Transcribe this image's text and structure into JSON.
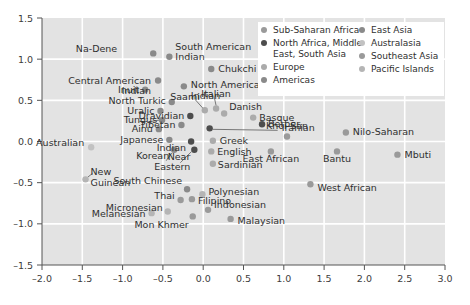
{
  "chart_data": {
    "type": "scatter",
    "title": "",
    "xlabel": "",
    "ylabel": "",
    "xlim": [
      -2.0,
      3.0
    ],
    "ylim": [
      -1.5,
      1.5
    ],
    "xticks": [
      "-2.0",
      "-1.5",
      "-1.0",
      "-0.5",
      "0.0",
      "0.5",
      "1.0",
      "1.5",
      "2.0",
      "2.5",
      "3.0"
    ],
    "yticks": [
      "1.5",
      "1.0",
      "0.5",
      "0.0",
      "-0.5",
      "-1.0",
      "-1.5"
    ],
    "grid": true,
    "grid_color": "#ffffff",
    "plot_background": "#e3e3e3",
    "legend_position": "top-right",
    "legend": [
      {
        "label": "Sub-Saharan Africa",
        "color": "#9a9a9a"
      },
      {
        "label": "North Africa, Middle East, South Asia",
        "color": "#4d4d4d"
      },
      {
        "label": "Europe",
        "color": "#ababab"
      },
      {
        "label": "Americas",
        "color": "#8a8a8a"
      },
      {
        "label": "East Asia",
        "color": "#8a8a8a"
      },
      {
        "label": "Australasia",
        "color": "#c2c2c2"
      },
      {
        "label": "Southeast Asia",
        "color": "#9a9a9a"
      },
      {
        "label": "Pacific Islands",
        "color": "#b5b5b5"
      }
    ],
    "points": [
      {
        "name": "Na-Dene",
        "x": -0.62,
        "y": 1.07,
        "color": "#8a8a8a",
        "label_dx": -36,
        "label_dy": -1,
        "anchor": "end"
      },
      {
        "name": "South American Indian",
        "x": -0.42,
        "y": 1.03,
        "color": "#8a8a8a",
        "label_dx": 6,
        "label_dy": -7,
        "anchor": "start",
        "lines": 2,
        "line2": "Indian"
      },
      {
        "name": "Chukchi",
        "x": 0.1,
        "y": 0.88,
        "color": "#8a8a8a",
        "label_dx": 7,
        "label_dy": 3,
        "anchor": "start"
      },
      {
        "name": "Central American Indian",
        "x": -0.56,
        "y": 0.74,
        "color": "#8a8a8a",
        "label_dx": -7,
        "label_dy": 3,
        "anchor": "end",
        "lines": 2
      },
      {
        "name": "North American Indian",
        "x": -0.24,
        "y": 0.67,
        "color": "#8a8a8a",
        "label_dx": 7,
        "label_dy": 2,
        "anchor": "start",
        "lines": 2
      },
      {
        "name": "Inuit",
        "x": -0.72,
        "y": 0.63,
        "color": "#8a8a8a",
        "label_dx": -6,
        "label_dy": 3,
        "anchor": "end"
      },
      {
        "name": "North Turkic",
        "x": -0.39,
        "y": 0.48,
        "color": "#8a8a8a",
        "label_dx": -6,
        "label_dy": 2,
        "anchor": "end"
      },
      {
        "name": "Saami",
        "x": 0.02,
        "y": 0.38,
        "color": "#ababab",
        "label_dx": -5,
        "label_dy": -10,
        "anchor": "end"
      },
      {
        "name": "Italian",
        "x": 0.16,
        "y": 0.4,
        "color": "#ababab",
        "label_dx": 0,
        "label_dy": -12,
        "anchor": "middle"
      },
      {
        "name": "Danish",
        "x": 0.26,
        "y": 0.34,
        "color": "#ababab",
        "label_dx": 5,
        "label_dy": -4,
        "anchor": "start"
      },
      {
        "name": "Uralic",
        "x": -0.53,
        "y": 0.37,
        "color": "#8a8a8a",
        "label_dx": -6,
        "label_dy": 3,
        "anchor": "end"
      },
      {
        "name": "Dravidian",
        "x": -0.16,
        "y": 0.31,
        "color": "#4d4d4d",
        "label_dx": -6,
        "label_dy": 3,
        "anchor": "end"
      },
      {
        "name": "Tungus",
        "x": -0.51,
        "y": 0.26,
        "color": "#8a8a8a",
        "label_dx": -5,
        "label_dy": 3,
        "anchor": "end"
      },
      {
        "name": "Basque",
        "x": 0.62,
        "y": 0.29,
        "color": "#ababab",
        "label_dx": 6,
        "label_dy": 3,
        "anchor": "start"
      },
      {
        "name": "Tibetan",
        "x": -0.27,
        "y": 0.2,
        "color": "#8a8a8a",
        "label_dx": -6,
        "label_dy": 3,
        "anchor": "end"
      },
      {
        "name": "Berber",
        "x": 0.73,
        "y": 0.21,
        "color": "#4d4d4d",
        "label_dx": 6,
        "label_dy": 3,
        "anchor": "start"
      },
      {
        "name": "Ainu",
        "x": -0.55,
        "y": 0.15,
        "color": "#8a8a8a",
        "label_dx": -6,
        "label_dy": 3,
        "anchor": "end"
      },
      {
        "name": "Iranian",
        "x": 0.08,
        "y": 0.16,
        "color": "#4d4d4d",
        "label_dx": 72,
        "label_dy": 3,
        "anchor": "start",
        "leader": true
      },
      {
        "name": "Khoi-San",
        "x": 1.04,
        "y": 0.06,
        "color": "#9a9a9a",
        "label_dx": 0,
        "label_dy": -8,
        "anchor": "middle"
      },
      {
        "name": "Nilo-Saharan",
        "x": 1.77,
        "y": 0.11,
        "color": "#9a9a9a",
        "label_dx": 7,
        "label_dy": 3,
        "anchor": "start"
      },
      {
        "name": "Japanese",
        "x": -0.42,
        "y": 0.02,
        "color": "#8a8a8a",
        "label_dx": -6,
        "label_dy": 3,
        "anchor": "end"
      },
      {
        "name": "Indian",
        "x": -0.15,
        "y": 0.0,
        "color": "#4d4d4d",
        "label_dx": -5,
        "label_dy": 9,
        "anchor": "end"
      },
      {
        "name": "Greek",
        "x": 0.12,
        "y": 0.01,
        "color": "#ababab",
        "label_dx": 7,
        "label_dy": 3,
        "anchor": "start"
      },
      {
        "name": "Australian",
        "x": -1.39,
        "y": -0.07,
        "color": "#c2c2c2",
        "label_dx": -7,
        "label_dy": -1,
        "anchor": "end"
      },
      {
        "name": "Korean",
        "x": -0.36,
        "y": -0.1,
        "color": "#8a8a8a",
        "label_dx": -5,
        "label_dy": 9,
        "anchor": "end"
      },
      {
        "name": "Near Eastern",
        "x": -0.11,
        "y": -0.1,
        "color": "#4d4d4d",
        "label_dx": -4,
        "label_dy": 10,
        "anchor": "end",
        "lines": 2
      },
      {
        "name": "English",
        "x": 0.1,
        "y": -0.12,
        "color": "#ababab",
        "label_dx": 6,
        "label_dy": 4,
        "anchor": "start"
      },
      {
        "name": "East African",
        "x": 0.84,
        "y": -0.12,
        "color": "#9a9a9a",
        "label_dx": 0,
        "label_dy": 11,
        "anchor": "middle"
      },
      {
        "name": "Bantu",
        "x": 1.66,
        "y": -0.12,
        "color": "#9a9a9a",
        "label_dx": 0,
        "label_dy": 11,
        "anchor": "middle"
      },
      {
        "name": "Mbuti",
        "x": 2.41,
        "y": -0.16,
        "color": "#9a9a9a",
        "label_dx": 7,
        "label_dy": 3,
        "anchor": "start"
      },
      {
        "name": "Sardinian",
        "x": 0.12,
        "y": -0.27,
        "color": "#ababab",
        "label_dx": 5,
        "label_dy": 4,
        "anchor": "start"
      },
      {
        "name": "New Guinean",
        "x": -1.46,
        "y": -0.46,
        "color": "#b5b5b5",
        "label_dx": 5,
        "label_dy": -4,
        "anchor": "start",
        "lines": 2
      },
      {
        "name": "West African",
        "x": 1.33,
        "y": -0.52,
        "color": "#9a9a9a",
        "label_dx": 7,
        "label_dy": 7,
        "anchor": "start"
      },
      {
        "name": "South Chinese",
        "x": -0.2,
        "y": -0.58,
        "color": "#8a8a8a",
        "label_dx": -5,
        "label_dy": -5,
        "anchor": "end"
      },
      {
        "name": "Polynesian",
        "x": -0.01,
        "y": -0.64,
        "color": "#b5b5b5",
        "label_dx": 6,
        "label_dy": 1,
        "anchor": "start"
      },
      {
        "name": "Thai",
        "x": -0.28,
        "y": -0.71,
        "color": "#9a9a9a",
        "label_dx": -6,
        "label_dy": -1,
        "anchor": "end"
      },
      {
        "name": "Filipino",
        "x": -0.14,
        "y": -0.7,
        "color": "#9a9a9a",
        "label_dx": 6,
        "label_dy": 5,
        "anchor": "start"
      },
      {
        "name": "Indonesian",
        "x": 0.06,
        "y": -0.83,
        "color": "#9a9a9a",
        "label_dx": 6,
        "label_dy": -2,
        "anchor": "start"
      },
      {
        "name": "Micronesian",
        "x": -0.44,
        "y": -0.85,
        "color": "#b5b5b5",
        "label_dx": -5,
        "label_dy": 0,
        "anchor": "end"
      },
      {
        "name": "Melanesian",
        "x": -0.64,
        "y": -0.87,
        "color": "#b5b5b5",
        "label_dx": -6,
        "label_dy": 4,
        "anchor": "end"
      },
      {
        "name": "Mon Khmer",
        "x": -0.13,
        "y": -0.91,
        "color": "#9a9a9a",
        "label_dx": -4,
        "label_dy": 12,
        "anchor": "end"
      },
      {
        "name": "Malaysian",
        "x": 0.34,
        "y": -0.94,
        "color": "#9a9a9a",
        "label_dx": 7,
        "label_dy": 5,
        "anchor": "start"
      }
    ]
  }
}
